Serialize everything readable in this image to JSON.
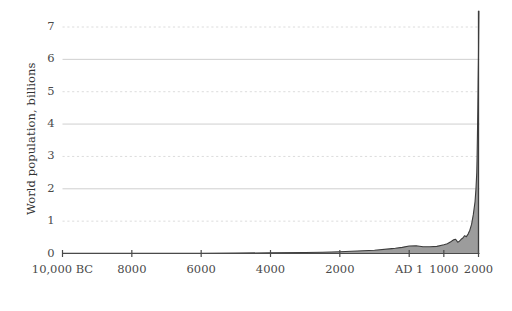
{
  "chart_data": {
    "type": "area",
    "title": "",
    "xlabel": "",
    "ylabel": "World population, billions",
    "xlim": [
      -10000,
      2000
    ],
    "ylim": [
      0,
      7.6
    ],
    "grid": true,
    "legend": null,
    "x_tick_values": [
      -10000,
      -8000,
      -6000,
      -4000,
      -2000,
      1,
      1000,
      2000
    ],
    "x_tick_labels": [
      "10,000 BC",
      "8000",
      "6000",
      "4000",
      "2000",
      "AD 1",
      "1000",
      "2000"
    ],
    "y_tick_values": [
      0,
      1,
      2,
      3,
      4,
      5,
      6,
      7
    ],
    "y_tick_labels": [
      "0",
      "1",
      "2",
      "3",
      "4",
      "5",
      "6",
      "7"
    ],
    "gridline_styles": {
      "1": "dashed",
      "2": "solid",
      "3": "dashed",
      "4": "solid",
      "5": "dashed",
      "6": "solid",
      "7": "dashed"
    },
    "series": [
      {
        "name": "World population",
        "fill_color": "#9c9c9c",
        "line_color": "#3c3c3c",
        "x": [
          -10000,
          -9000,
          -8000,
          -7000,
          -6000,
          -5000,
          -4000,
          -3000,
          -2500,
          -2000,
          -1500,
          -1000,
          -500,
          -400,
          -200,
          1,
          200,
          400,
          600,
          800,
          1000,
          1100,
          1200,
          1250,
          1300,
          1340,
          1400,
          1450,
          1500,
          1550,
          1600,
          1650,
          1700,
          1750,
          1800,
          1850,
          1900,
          1927,
          1950,
          1960,
          1970,
          1980,
          1990,
          2000,
          2011
        ],
        "y": [
          0.004,
          0.005,
          0.006,
          0.008,
          0.01,
          0.015,
          0.02,
          0.03,
          0.04,
          0.055,
          0.075,
          0.1,
          0.15,
          0.16,
          0.19,
          0.23,
          0.24,
          0.21,
          0.21,
          0.22,
          0.27,
          0.3,
          0.36,
          0.4,
          0.43,
          0.44,
          0.35,
          0.38,
          0.44,
          0.48,
          0.55,
          0.52,
          0.6,
          0.72,
          0.9,
          1.2,
          1.6,
          2.0,
          2.5,
          3.0,
          3.7,
          4.4,
          5.3,
          6.1,
          7.5
        ]
      }
    ],
    "annotations": []
  },
  "colors": {
    "grid_dashed": "#dcdcdc",
    "grid_solid": "#c9c9c9",
    "axis": "#4a4a4a",
    "text": "#4a4a4a",
    "area_fill": "#9c9c9c",
    "area_line": "#3c3c3c",
    "background": "#ffffff"
  }
}
